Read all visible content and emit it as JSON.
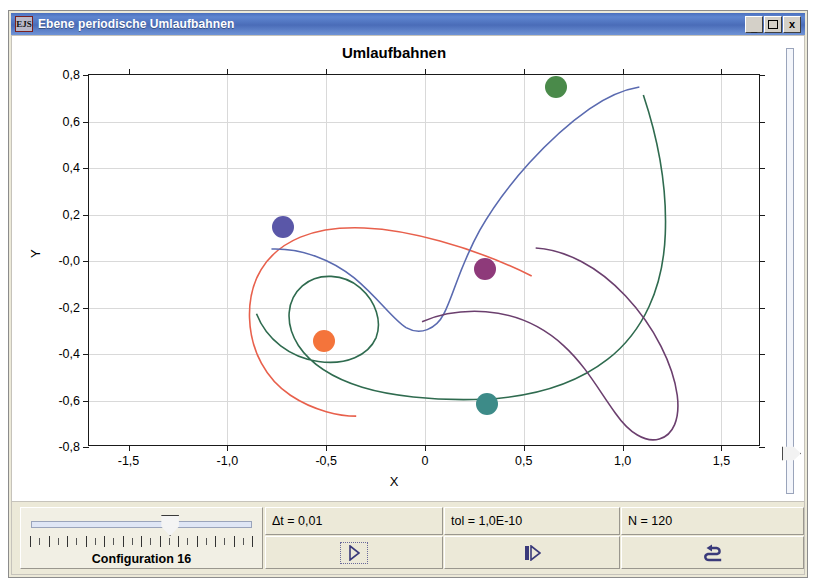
{
  "window": {
    "title": "Ebene periodische Umlaufbahnen",
    "icon": "ejs-app-icon",
    "buttons": {
      "minimize": "_",
      "maximize": "maximize-icon",
      "close": "x"
    }
  },
  "chart_data": {
    "type": "scatter",
    "title": "Umlaufbahnen",
    "xlabel": "X",
    "ylabel": "Y",
    "xlim": [
      -1.7,
      1.7
    ],
    "ylim": [
      -0.8,
      0.8
    ],
    "grid": true,
    "legend": "none",
    "xticks": [
      "-1,5",
      "-1,0",
      "-0,5",
      "0",
      "0,5",
      "1,0",
      "1,5"
    ],
    "xtick_values": [
      -1.5,
      -1.0,
      -0.5,
      0,
      0.5,
      1.0,
      1.5
    ],
    "yticks": [
      "0,8",
      "0,6",
      "0,4",
      "0,2",
      "-0,0",
      "-0,2",
      "-0,4",
      "-0,6",
      "-0,8"
    ],
    "ytick_values": [
      0.8,
      0.6,
      0.4,
      0.2,
      0.0,
      -0.2,
      -0.4,
      -0.6,
      -0.8
    ],
    "bodies": [
      {
        "name": "body-blue",
        "color": "#5a57a8",
        "x": -0.72,
        "y": 0.145
      },
      {
        "name": "body-orange",
        "color": "#f4743b",
        "x": -0.51,
        "y": -0.345
      },
      {
        "name": "body-purple",
        "color": "#8e3a7a",
        "x": 0.305,
        "y": -0.035
      },
      {
        "name": "body-green",
        "color": "#4a8a4a",
        "x": 0.665,
        "y": 0.75
      },
      {
        "name": "body-teal",
        "color": "#3d8b88",
        "x": 0.315,
        "y": -0.615
      }
    ],
    "trajectories": [
      {
        "name": "orbit-red",
        "color": "#e8604c"
      },
      {
        "name": "orbit-blue",
        "color": "#5a6ab0"
      },
      {
        "name": "orbit-green",
        "color": "#2f6b4f"
      },
      {
        "name": "orbit-purple",
        "color": "#6b3f6e"
      }
    ]
  },
  "time_badge": {
    "label": "t=3,540",
    "background": "#ffee00"
  },
  "controls": {
    "configuration_label": "Configuration 16",
    "slider_name": "configuration-slider",
    "slider_value": 16,
    "slider_min": 1,
    "slider_max": 25,
    "vertical_slider_name": "zoom-slider",
    "fields": [
      {
        "name": "delta-t-field",
        "text": "Δt = 0,01"
      },
      {
        "name": "tolerance-field",
        "text": "tol = 1,0E-10"
      },
      {
        "name": "steps-field",
        "text": "N = 120"
      }
    ],
    "buttons": [
      {
        "name": "play-button",
        "icon": "play-icon"
      },
      {
        "name": "step-button",
        "icon": "step-forward-icon"
      },
      {
        "name": "reset-button",
        "icon": "reset-arrow-icon"
      }
    ]
  }
}
